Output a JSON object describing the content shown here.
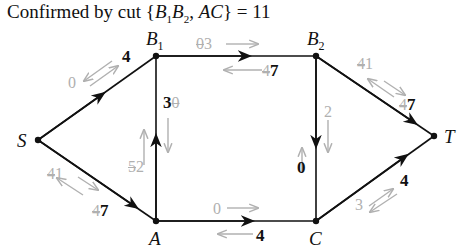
{
  "title": {
    "text": "Confirmed by cut {B1B2, AC} = 11",
    "prefix": "Confirmed by cut {",
    "b": "B",
    "sub1": "1",
    "sub2": "2",
    "mid": ", ",
    "ac": "AC",
    "suffix": "} = 11"
  },
  "nodes": {
    "S": "S",
    "B1": "B",
    "B1_sub": "1",
    "B2": "B",
    "B2_sub": "2",
    "A": "A",
    "C": "C",
    "T": "T"
  },
  "edges": {
    "S_B1": {
      "flow": "4",
      "back": "0"
    },
    "B1_B2": {
      "forward_old": "0",
      "forward_new": "3",
      "back_old": "4",
      "flow": "7"
    },
    "B2_T": {
      "forward_old": "4",
      "forward_new": "1",
      "back_old": "4",
      "flow": "7"
    },
    "S_A": {
      "forward_old": "4",
      "forward_new": "1",
      "back_old": "4",
      "flow": "7"
    },
    "A_B1": {
      "flow": "3",
      "back_old": "0",
      "forward_old": "5",
      "forward_new": "2"
    },
    "B2_C": {
      "forward": "2",
      "flow": "0"
    },
    "A_C": {
      "forward": "0",
      "flow": "4"
    },
    "C_T": {
      "back": "3",
      "flow": "4"
    }
  },
  "colors": {
    "edge": "#111111",
    "residual": "#b0b0b0"
  }
}
